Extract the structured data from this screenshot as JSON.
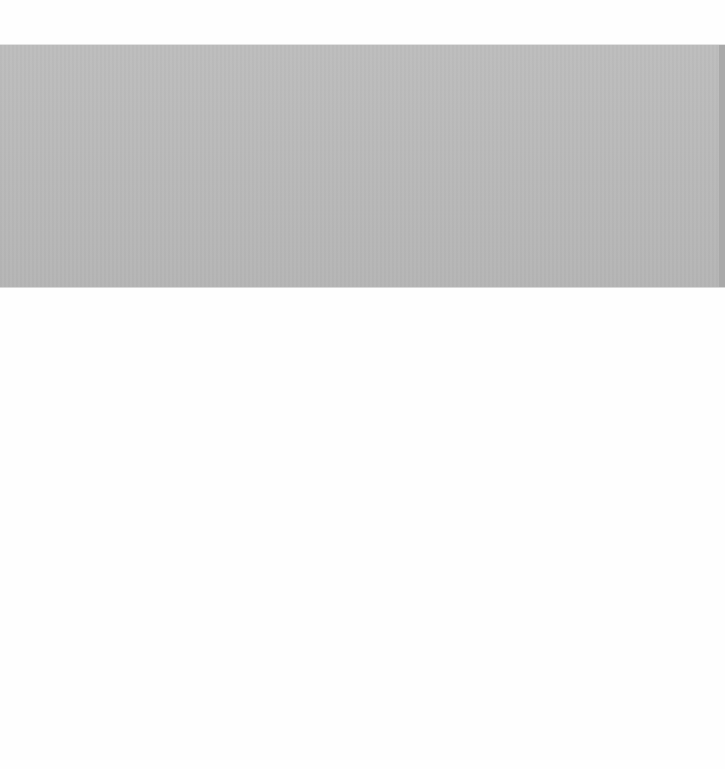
{
  "page": {
    "background_color": "#fefefe"
  },
  "banner": {
    "color": "#b9b9b9",
    "edge_color": "#a9a9a9",
    "text": ""
  }
}
